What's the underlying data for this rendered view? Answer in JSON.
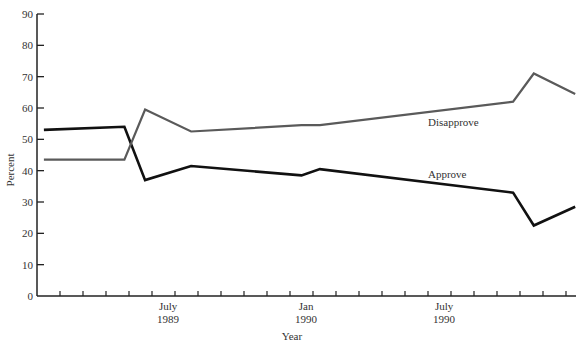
{
  "chart_data": {
    "type": "line",
    "title": "",
    "xlabel": "Year",
    "ylabel": "Percent",
    "ylim": [
      0,
      90
    ],
    "yticks": [
      0,
      10,
      20,
      30,
      40,
      50,
      60,
      70,
      80,
      90
    ],
    "x_tick_labels": [
      {
        "label": "July",
        "sub": "1989",
        "month_index": 5
      },
      {
        "label": "Jan",
        "sub": "1990",
        "month_index": 11
      },
      {
        "label": "July",
        "sub": "1990",
        "month_index": 17
      }
    ],
    "x_minor_ticks_count": 23,
    "grid": false,
    "legend": "inline labels",
    "series": [
      {
        "name": "Approve",
        "color": "#111111",
        "points": [
          {
            "m": 0.3,
            "v": 53
          },
          {
            "m": 3.8,
            "v": 54
          },
          {
            "m": 4.7,
            "v": 37
          },
          {
            "m": 6.7,
            "v": 41.5
          },
          {
            "m": 11.5,
            "v": 38.5
          },
          {
            "m": 12.3,
            "v": 40.5
          },
          {
            "m": 20.7,
            "v": 33
          },
          {
            "m": 21.6,
            "v": 22.5
          },
          {
            "m": 23.4,
            "v": 28.5
          }
        ]
      },
      {
        "name": "Disapprove",
        "color": "#5a5a5a",
        "points": [
          {
            "m": 0.3,
            "v": 43.5
          },
          {
            "m": 3.8,
            "v": 43.5
          },
          {
            "m": 4.7,
            "v": 59.5
          },
          {
            "m": 6.7,
            "v": 52.5
          },
          {
            "m": 11.5,
            "v": 54.5
          },
          {
            "m": 12.3,
            "v": 54.5
          },
          {
            "m": 20.7,
            "v": 62
          },
          {
            "m": 21.6,
            "v": 71
          },
          {
            "m": 23.4,
            "v": 64.5
          }
        ]
      }
    ],
    "annotations": [
      {
        "text": "Disapprove",
        "x_px": 428,
        "y_px": 126
      },
      {
        "text": "Approve",
        "x_px": 428,
        "y_px": 178
      }
    ]
  }
}
